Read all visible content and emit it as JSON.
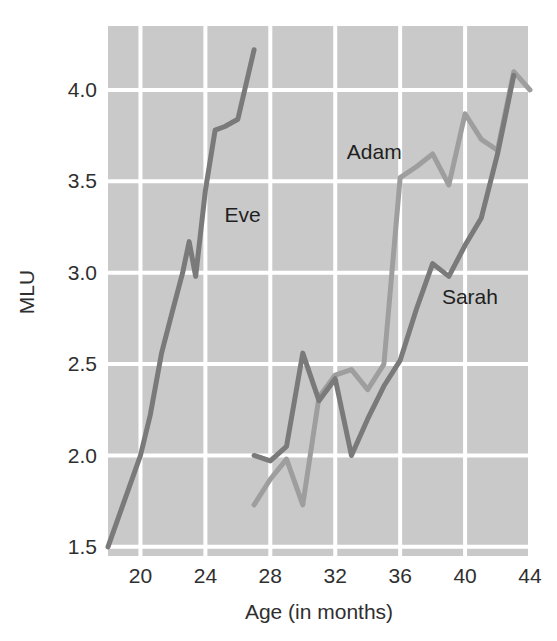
{
  "chart_data": {
    "type": "line",
    "title": "",
    "subtitle": "",
    "xlabel": "Age (in months)",
    "ylabel": "MLU",
    "xlim": [
      18,
      44
    ],
    "ylim": [
      1.45,
      4.35
    ],
    "xticks": [
      20,
      24,
      28,
      32,
      36,
      40,
      44
    ],
    "xtick_labels": [
      "20",
      "24",
      "28",
      "32",
      "36",
      "40",
      "44"
    ],
    "yticks": [
      1.5,
      2.0,
      2.5,
      3.0,
      3.5,
      4.0
    ],
    "ytick_labels": [
      "1.5",
      "2.0",
      "2.5",
      "3.0",
      "3.5",
      "4.0"
    ],
    "grid": true,
    "grid_color": "#ffffff",
    "plot_background": "#c9c9c9",
    "legend_position": "inline-annotations",
    "series": [
      {
        "name": "Eve",
        "color": "#7a7a7a",
        "label_x": 26.3,
        "label_y": 3.28,
        "x": [
          18.0,
          20.0,
          20.6,
          21.3,
          22.0,
          22.6,
          23.0,
          23.4,
          24.0,
          24.6,
          25.2,
          26.0,
          27.0
        ],
        "y": [
          1.5,
          2.0,
          2.22,
          2.56,
          2.8,
          3.0,
          3.17,
          2.98,
          3.45,
          3.78,
          3.8,
          3.84,
          4.22
        ]
      },
      {
        "name": "Adam",
        "color": "#9e9e9e",
        "label_x": 34.4,
        "label_y": 3.62,
        "x": [
          27.0,
          28.0,
          29.0,
          30.0,
          31.0,
          32.0,
          33.0,
          34.0,
          35.0,
          36.0,
          37.0,
          38.0,
          39.0,
          40.0,
          41.0,
          42.0,
          43.0,
          44.0
        ],
        "y": [
          1.73,
          1.87,
          1.98,
          1.73,
          2.32,
          2.44,
          2.47,
          2.36,
          2.5,
          3.52,
          3.58,
          3.65,
          3.48,
          3.87,
          3.73,
          3.67,
          4.1,
          4.0
        ]
      },
      {
        "name": "Sarah",
        "color": "#7a7a7a",
        "label_x": 40.3,
        "label_y": 2.83,
        "x": [
          27.0,
          28.0,
          29.0,
          30.0,
          31.0,
          32.0,
          33.0,
          34.0,
          35.0,
          36.0,
          37.0,
          38.0,
          39.0,
          40.0,
          41.0,
          42.0,
          43.0
        ],
        "y": [
          2.0,
          1.97,
          2.05,
          2.56,
          2.3,
          2.42,
          2.0,
          2.2,
          2.38,
          2.52,
          2.8,
          3.05,
          2.98,
          3.15,
          3.3,
          3.65,
          4.08
        ]
      }
    ]
  },
  "axes": {
    "x_title": "Age (in months)",
    "y_title": "MLU"
  }
}
